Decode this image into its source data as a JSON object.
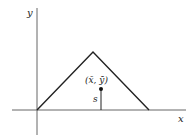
{
  "diagram": {
    "axes": {
      "x_label": "x",
      "y_label": "y"
    },
    "triangle": {
      "vertices": [
        [
          37,
          110
        ],
        [
          93,
          52
        ],
        [
          149,
          110
        ]
      ]
    },
    "centroid": {
      "label": "(x̄, ȳ)",
      "point": [
        101,
        89
      ]
    },
    "distance": {
      "label": "s"
    },
    "colors": {
      "stroke": "#222222",
      "axis": "#555555"
    }
  }
}
